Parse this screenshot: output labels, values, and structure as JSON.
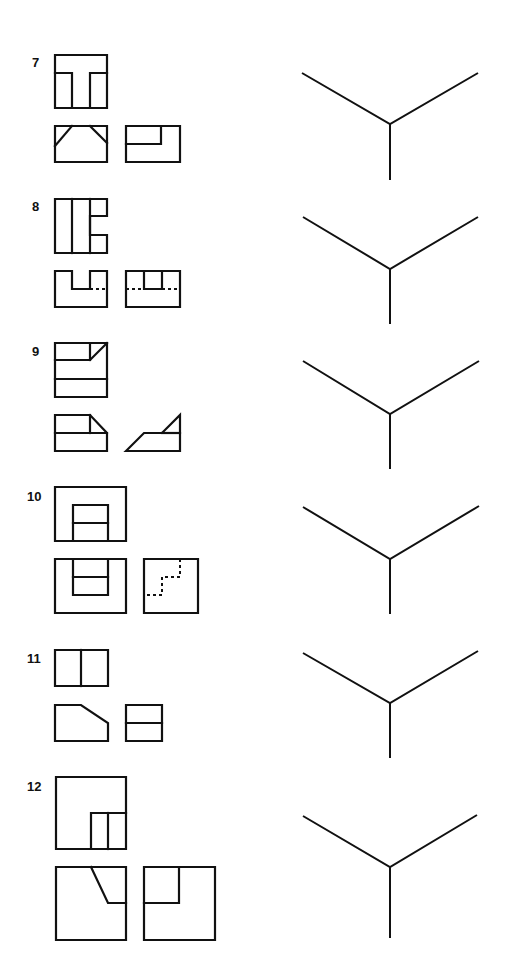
{
  "page": {
    "background": "#ffffff",
    "ink_color": "#111111"
  },
  "problems": [
    {
      "number": "7",
      "label_pos": [
        32,
        67
      ],
      "views": [
        {
          "name": "top-view",
          "solid": [
            "M55 55 H107 V108 H55 Z",
            "M55 73 H72 V108",
            "M107 73 H90 V108"
          ],
          "hidden": []
        },
        {
          "name": "front-view",
          "solid": [
            "M55 126 H107 V162 H55 Z",
            "M55 146 L72 126",
            "M90 126 L107 143"
          ],
          "hidden": []
        },
        {
          "name": "side-view",
          "solid": [
            "M126 126 H180 V162 H126 Z",
            "M126 144 H161 V126"
          ],
          "hidden": []
        }
      ],
      "axis": {
        "left": [
          302,
          73
        ],
        "right": [
          478,
          73
        ],
        "center": [
          390,
          124
        ],
        "bottom": [
          390,
          180
        ]
      }
    },
    {
      "number": "8",
      "label_pos": [
        32,
        211
      ],
      "views": [
        {
          "name": "top-view",
          "solid": [
            "M55 199 H107 V216 H90 V235 H107 V253 H55 Z",
            "M72 199 V253",
            "M90 199 V253"
          ],
          "hidden": []
        },
        {
          "name": "front-view",
          "solid": [
            "M55 271 H72 V289 H90 V271 H107 V307 H55 Z"
          ],
          "hidden": [
            "M90 289 H107"
          ]
        },
        {
          "name": "side-view",
          "solid": [
            "M126 271 H180 V307 H126 Z",
            "M144 271 V289 H162 V271"
          ],
          "hidden": [
            "M126 289 H144",
            "M162 289 H180"
          ]
        }
      ],
      "axis": {
        "left": [
          303,
          217
        ],
        "right": [
          478,
          217
        ],
        "center": [
          390,
          269
        ],
        "bottom": [
          390,
          324
        ]
      }
    },
    {
      "number": "9",
      "label_pos": [
        32,
        356
      ],
      "views": [
        {
          "name": "top-view",
          "solid": [
            "M55 343 H107 V397 H55 Z",
            "M55 360 H90 V343",
            "M90 360 L107 343",
            "M55 379 H107"
          ],
          "hidden": []
        },
        {
          "name": "front-view",
          "solid": [
            "M55 415 H90 L107 433 V451 H55 Z",
            "M90 415 V433",
            "M55 433 H107"
          ],
          "hidden": []
        },
        {
          "name": "side-view",
          "solid": [
            "M126 451 L144 433 H162 L180 415 V451 Z",
            "M162 433 H180"
          ],
          "hidden": []
        }
      ],
      "axis": {
        "left": [
          303,
          361
        ],
        "right": [
          479,
          361
        ],
        "center": [
          390,
          414
        ],
        "bottom": [
          390,
          469
        ]
      }
    },
    {
      "number": "10",
      "label_pos": [
        27,
        501
      ],
      "views": [
        {
          "name": "top-view",
          "solid": [
            "M55 487 H126 V541 H55 Z",
            "M73 541 V505 H108 V541",
            "M73 523 H108"
          ],
          "hidden": []
        },
        {
          "name": "front-view",
          "solid": [
            "M55 559 H126 V613 H55 Z",
            "M73 559 V595 H108 V559",
            "M73 577 H108"
          ],
          "hidden": []
        },
        {
          "name": "side-view",
          "solid": [
            "M144 559 H198 V613 H144 Z"
          ],
          "hidden": [
            "M180 559 V577 H162 V595 H144"
          ]
        }
      ],
      "axis": {
        "left": [
          303,
          507
        ],
        "right": [
          479,
          506
        ],
        "center": [
          390,
          559
        ],
        "bottom": [
          390,
          614
        ]
      }
    },
    {
      "number": "11",
      "label_pos": [
        27,
        663
      ],
      "views": [
        {
          "name": "top-view",
          "solid": [
            "M55 650 H108 V686 H55 Z",
            "M81 650 V686"
          ],
          "hidden": []
        },
        {
          "name": "front-view",
          "solid": [
            "M55 705 H81 L108 723 V741 H55 Z"
          ],
          "hidden": []
        },
        {
          "name": "side-view",
          "solid": [
            "M126 705 H162 V741 H126 Z",
            "M126 723 H162"
          ],
          "hidden": []
        }
      ],
      "axis": {
        "left": [
          303,
          653
        ],
        "right": [
          478,
          651
        ],
        "center": [
          390,
          703
        ],
        "bottom": [
          390,
          758
        ]
      }
    },
    {
      "number": "12",
      "label_pos": [
        27,
        791
      ],
      "views": [
        {
          "name": "top-view",
          "solid": [
            "M56 777 H126 V849 H56 Z",
            "M91 849 V813 H126",
            "M108 813 V849"
          ],
          "hidden": []
        },
        {
          "name": "front-view",
          "solid": [
            "M56 867 H126 V940 H56 Z",
            "M91 867 L108 903 H126"
          ],
          "hidden": []
        },
        {
          "name": "side-view",
          "solid": [
            "M144 867 H215 V940 H144 Z",
            "M179 867 V903 H144"
          ],
          "hidden": []
        }
      ],
      "axis": {
        "left": [
          303,
          816
        ],
        "right": [
          477,
          815
        ],
        "center": [
          390,
          867
        ],
        "bottom": [
          390,
          938
        ]
      }
    }
  ]
}
